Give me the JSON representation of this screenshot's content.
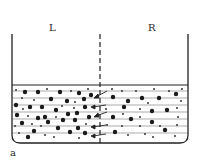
{
  "diagram": {
    "type": "osmosis-beaker",
    "labels": {
      "left": "L",
      "right": "R",
      "panel": "a"
    },
    "colors": {
      "line": "#222222",
      "particle": "#1a1a1a",
      "background": "#ffffff"
    },
    "membrane": {
      "style": "dashed",
      "x": 100
    },
    "beaker": {
      "left": 12,
      "right": 188,
      "top": 34,
      "surface": 85,
      "bottom": 143
    },
    "arrows_count": 5
  }
}
